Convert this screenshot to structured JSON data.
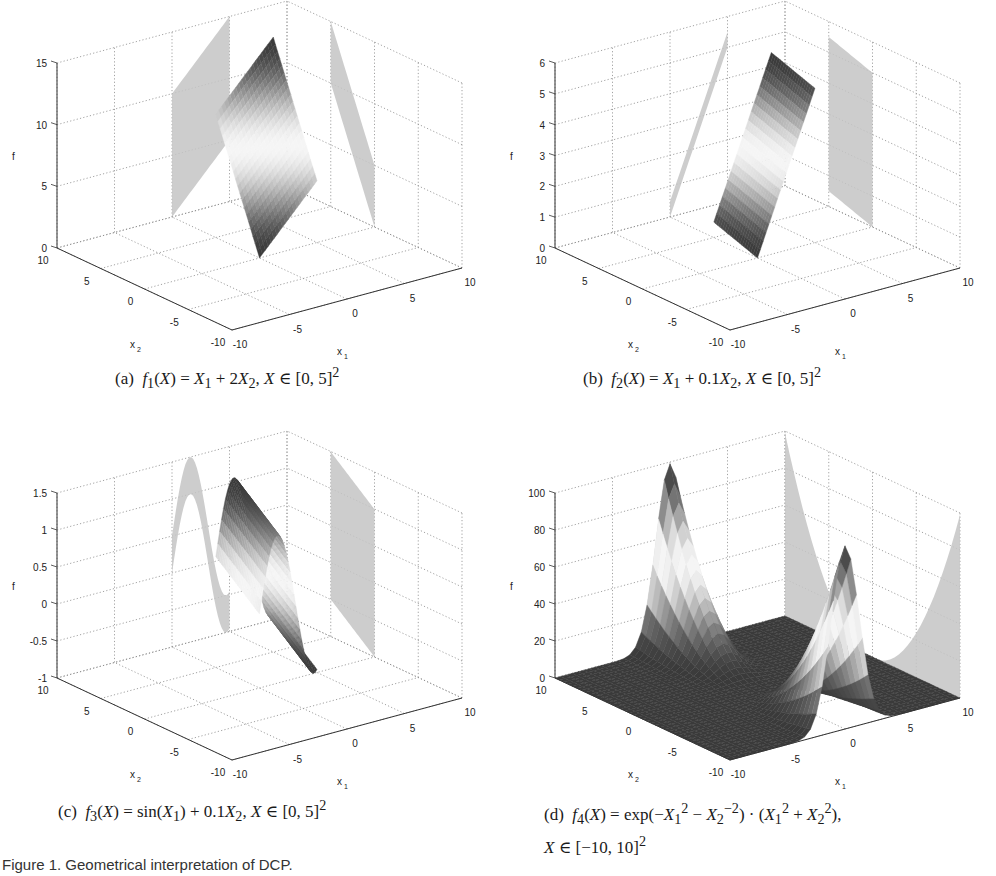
{
  "figure": {
    "caption": "Figure 1. Geometrical interpretation of DCP."
  },
  "panels": [
    {
      "id": "a",
      "label": "(a)",
      "formula_html": "<i>f</i><sub>1</sub>(<i>X</i>) = <i>X</i><sub>1</sub> + 2<i>X</i><sub>2</sub>, <i>X</i> ∈ [0, 5]<sup>2</sup>",
      "formula_text": "f1(X) = X1 + 2X2, X ∈ [0,5]^2"
    },
    {
      "id": "b",
      "label": "(b)",
      "formula_html": "<i>f</i><sub>2</sub>(<i>X</i>) = <i>X</i><sub>1</sub> + 0.1<i>X</i><sub>2</sub>, <i>X</i> ∈ [0, 5]<sup>2</sup>",
      "formula_text": "f2(X) = X1 + 0.1X2, X ∈ [0,5]^2"
    },
    {
      "id": "c",
      "label": "(c)",
      "formula_html": "<i>f</i><sub>3</sub>(<i>X</i>) = sin(<i>X</i><sub>1</sub>) + 0.1<i>X</i><sub>2</sub>, <i>X</i> ∈ [0, 5]<sup>2</sup>",
      "formula_text": "f3(X) = sin(X1) + 0.1X2, X ∈ [0,5]^2"
    },
    {
      "id": "d",
      "label": "(d)",
      "formula_html": "<i>f</i><sub>4</sub>(<i>X</i>) = exp(−<i>X</i><sub>1</sub><sup>2</sup> − <i>X</i><sub>2</sub><sup>−2</sup>) · (<i>X</i><sub>1</sub><sup>2</sup> + <i>X</i><sub>2</sub><sup>2</sup>),<br><i>X</i> ∈ [−10, 10]<sup>2</sup>",
      "formula_text": "f4(X) = exp(-X1^2 - X2^-2) · (X1^2 + X2^2), X ∈ [-10,10]^2"
    }
  ],
  "chart_data": [
    {
      "type": "surface3d",
      "title": "(a) f1(X) = X1 + 2X2, X ∈ [0,5]^2",
      "xlabel": "x1",
      "ylabel": "x2",
      "zlabel": "f",
      "xlim": [
        -10,
        10
      ],
      "ylim": [
        -10,
        10
      ],
      "zlim": [
        0,
        15
      ],
      "xticks": [
        -10,
        -5,
        0,
        5,
        10
      ],
      "yticks": [
        -10,
        -5,
        0,
        5,
        10
      ],
      "zticks": [
        0,
        5,
        10,
        15
      ],
      "zticklabels": [
        "0",
        "5",
        "10",
        "15"
      ],
      "grid": true,
      "domain": [
        [
          0,
          5
        ],
        [
          0,
          5
        ]
      ],
      "surface": {
        "z_corners": {
          "x1=0,x2=0": 0,
          "x1=5,x2=0": 5,
          "x1=0,x2=5": 10,
          "x1=5,x2=5": 15
        }
      },
      "projections": [
        "x2-f wall",
        "x1-f wall"
      ]
    },
    {
      "type": "surface3d",
      "title": "(b) f2(X) = X1 + 0.1X2, X ∈ [0,5]^2",
      "xlabel": "x1",
      "ylabel": "x2",
      "zlabel": "f",
      "xlim": [
        -10,
        10
      ],
      "ylim": [
        -10,
        10
      ],
      "zlim": [
        0,
        6
      ],
      "xticks": [
        -10,
        -5,
        0,
        5,
        10
      ],
      "yticks": [
        -10,
        -5,
        0,
        5,
        10
      ],
      "zticks": [
        0,
        1,
        2,
        3,
        4,
        5,
        6
      ],
      "zticklabels": [
        "0",
        "1",
        "2",
        "3",
        "4",
        "5",
        "6"
      ],
      "grid": true,
      "domain": [
        [
          0,
          5
        ],
        [
          0,
          5
        ]
      ],
      "surface": {
        "z_corners": {
          "x1=0,x2=0": 0,
          "x1=5,x2=0": 5,
          "x1=0,x2=5": 0.5,
          "x1=5,x2=5": 5.5
        }
      },
      "projections": [
        "x2-f wall",
        "x1-f wall"
      ]
    },
    {
      "type": "surface3d",
      "title": "(c) f3(X) = sin(X1) + 0.1X2, X ∈ [0,5]^2",
      "xlabel": "x1",
      "ylabel": "x2",
      "zlabel": "f",
      "xlim": [
        -10,
        10
      ],
      "ylim": [
        -10,
        10
      ],
      "zlim": [
        -1,
        1.5
      ],
      "xticks": [
        -10,
        -5,
        0,
        5,
        10
      ],
      "yticks": [
        -10,
        -5,
        0,
        5,
        10
      ],
      "zticks": [
        -1,
        -0.5,
        0,
        0.5,
        1,
        1.5
      ],
      "zticklabels": [
        "-1",
        "-0.5",
        "0",
        "0.5",
        "1",
        "1.5"
      ],
      "grid": true,
      "domain": [
        [
          0,
          5
        ],
        [
          0,
          5
        ]
      ],
      "surface": {
        "z_range": [
          -0.96,
          1.5
        ]
      },
      "projections": [
        "x2-f wall",
        "x1-f wall"
      ]
    },
    {
      "type": "surface3d",
      "title": "(d) f4(X) = exp(-X1^2 - X2^-2) · (X1^2 + X2^2), X ∈ [-10,10]^2",
      "xlabel": "x1",
      "ylabel": "x2",
      "zlabel": "f",
      "xlim": [
        -10,
        10
      ],
      "ylim": [
        -10,
        10
      ],
      "zlim": [
        0,
        100
      ],
      "xticks": [
        -10,
        -5,
        0,
        5,
        10
      ],
      "yticks": [
        -10,
        -5,
        0,
        5,
        10
      ],
      "zticks": [
        0,
        20,
        40,
        60,
        80,
        100
      ],
      "zticklabels": [
        "0",
        "20",
        "40",
        "60",
        "80",
        "100"
      ],
      "grid": true,
      "domain": [
        [
          -10,
          10
        ],
        [
          -10,
          10
        ]
      ],
      "surface": {
        "peaks": [
          {
            "x1": 0,
            "x2": 10,
            "f": 100
          },
          {
            "x1": 0,
            "x2": -10,
            "f": 100
          }
        ],
        "floor": 0
      },
      "projections": [
        "x2-f wall",
        "x1-f wall"
      ]
    }
  ],
  "tick_labels": {
    "x": [
      "-10",
      "-5",
      "0",
      "5",
      "10"
    ],
    "y": [
      "-10",
      "-5",
      "0",
      "5",
      "10"
    ]
  },
  "axis_labels": {
    "x": "x",
    "x_sub": "1",
    "y": "x",
    "y_sub": "2",
    "z": "f"
  },
  "layout": {
    "panel_offsets": [
      [
        0,
        0
      ],
      [
        498,
        0
      ],
      [
        0,
        438
      ],
      [
        498,
        438
      ]
    ],
    "caption_positions": [
      [
        115,
        376
      ],
      [
        619,
        376
      ],
      [
        58,
        808
      ],
      [
        544,
        806
      ]
    ],
    "surface_shade_dark": "#3a3a3a",
    "surface_shade_light": "#f4f4f4",
    "wall_shade": "#c4c4c4",
    "grid_color": "#8a8a8a"
  }
}
